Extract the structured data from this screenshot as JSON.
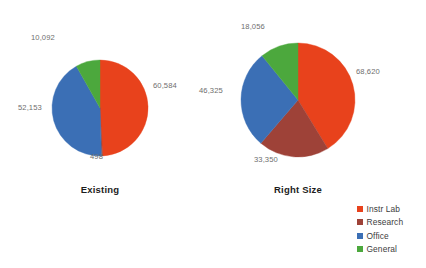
{
  "chart_data": [
    {
      "type": "pie",
      "title": "Existing",
      "categories": [
        "Instr Lab",
        "Research",
        "Office",
        "General"
      ],
      "values": [
        60584,
        498,
        52153,
        10092
      ],
      "labels": [
        "60,584",
        "498",
        "52,153",
        "10,092"
      ],
      "total": 123327,
      "colors": [
        "#e8421c",
        "#9e4238",
        "#3b6fb5",
        "#4ca83d"
      ],
      "start_angle_deg": 0,
      "direction": "clockwise",
      "radius_px": 48,
      "xlabel": "",
      "ylabel": "",
      "grid": false,
      "data_labels": true
    },
    {
      "type": "pie",
      "title": "Right Size",
      "categories": [
        "Instr Lab",
        "Research",
        "Office",
        "General"
      ],
      "values": [
        68620,
        33350,
        46325,
        18056
      ],
      "labels": [
        "68,620",
        "33,350",
        "46,325",
        "18,056"
      ],
      "total": 166351,
      "colors": [
        "#e8421c",
        "#9e4238",
        "#3b6fb5",
        "#4ca83d"
      ],
      "start_angle_deg": 0,
      "direction": "clockwise",
      "radius_px": 57,
      "xlabel": "",
      "ylabel": "",
      "grid": false,
      "data_labels": true
    }
  ],
  "legend": {
    "position": "bottom-right",
    "items": [
      {
        "label": "Instr Lab",
        "color": "#e8421c"
      },
      {
        "label": "Research",
        "color": "#9e4238"
      },
      {
        "label": "Office",
        "color": "#3b6fb5"
      },
      {
        "label": "General",
        "color": "#4ca83d"
      }
    ]
  },
  "pie_existing": {
    "title": "Existing",
    "label_general": "10,092",
    "label_instrlab": "60,584",
    "label_office": "52,153",
    "label_research": "498"
  },
  "pie_rightsize": {
    "title": "Right Size",
    "label_general": "18,056",
    "label_instrlab": "68,620",
    "label_office": "46,325",
    "label_research": "33,350"
  }
}
